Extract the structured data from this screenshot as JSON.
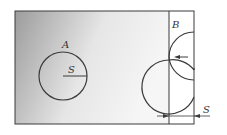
{
  "labels": {
    "region_a": "A",
    "region_b": "B",
    "radius_a": "S",
    "offset_s": "S"
  },
  "colors": {
    "stroke": "#3a3a3a",
    "gradient_dark": "#9a9a9a",
    "gradient_light": "#f4f4f4",
    "background": "#ffffff"
  }
}
